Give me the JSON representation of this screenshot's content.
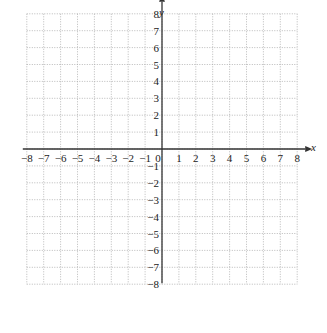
{
  "chart_data": {
    "type": "scatter",
    "title": "",
    "xlabel": "x",
    "ylabel": "y",
    "xlim": [
      -8,
      8
    ],
    "ylim": [
      -8,
      8
    ],
    "grid": true,
    "grid_style": "dotted",
    "x_ticks": [
      "-8",
      "-7",
      "-6",
      "-5",
      "-4",
      "-3",
      "-2",
      "-1",
      "0",
      "1",
      "2",
      "3",
      "4",
      "5",
      "6",
      "7",
      "8"
    ],
    "y_ticks": [
      "8",
      "7",
      "6",
      "5",
      "4",
      "3",
      "2",
      "1",
      "-1",
      "-2",
      "-3",
      "-4",
      "-5",
      "-6",
      "-7",
      "-8"
    ],
    "series": [],
    "legend": null
  },
  "axes": {
    "x_label": "x",
    "y_label": "y",
    "origin_label": "0"
  }
}
